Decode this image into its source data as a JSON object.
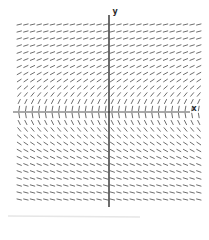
{
  "figure": {
    "background_color": "#ffffff",
    "x_axis_color": "#555555",
    "y_axis_color": "#2e2e2e",
    "segment_color": "#6e6e6e",
    "artifact_color": "#d9d9d9"
  },
  "chart_data": {
    "type": "slope_field",
    "title": "",
    "subtitle": "",
    "equation": "dy/dx = 1/y",
    "xlabel": "x",
    "ylabel": "y",
    "x_range": [
      -4.5,
      4.5
    ],
    "y_range": [
      -4.2,
      4.2
    ],
    "grid": {
      "columns": 28,
      "rows": 26,
      "col_spacing_px": 6.65,
      "row_spacing_px": 7.0,
      "segment_length_px": 5.4
    },
    "axes": {
      "origin_px": [
        109,
        112
      ],
      "x_axis_span_px": [
        13,
        190
      ],
      "y_axis_span_px": [
        15,
        207
      ],
      "px_per_unit": 21,
      "ticks": "none",
      "grid_lines": "off",
      "legend": "none"
    },
    "field_description": {
      "top_rows": "shallow positive slopes",
      "above_x_axis": "slopes steepen to nearly vertical approaching y = 0 from above",
      "below_x_axis": "nearly vertical negative slopes flattening toward bottom",
      "x_dependence": "none - slope constant along each horizontal row"
    }
  },
  "artifact": {
    "note": "faint horizontal scan line near bottom-left edge"
  }
}
